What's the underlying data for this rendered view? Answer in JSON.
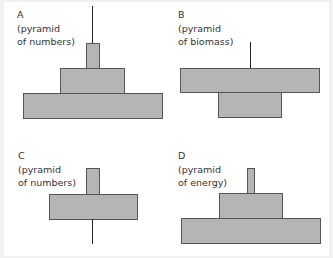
{
  "panels": [
    {
      "id": "A",
      "letter": "A",
      "caption_line1": "(pyramid",
      "caption_line2": "of numbers)",
      "type": "pyramid of numbers",
      "levels_top_to_bottom": [
        "narrow top bar with line above",
        "medium",
        "wide base"
      ]
    },
    {
      "id": "B",
      "letter": "B",
      "caption_line1": "(pyramid",
      "caption_line2": "of biomass)",
      "type": "pyramid of biomass",
      "levels_top_to_bottom": [
        "line",
        "wide",
        "medium"
      ]
    },
    {
      "id": "C",
      "letter": "C",
      "caption_line1": "(pyramid",
      "caption_line2": "of numbers)",
      "type": "pyramid of numbers",
      "levels_top_to_bottom": [
        "narrow",
        "wide",
        "line"
      ]
    },
    {
      "id": "D",
      "letter": "D",
      "caption_line1": "(pyramid",
      "caption_line2": "of energy)",
      "type": "pyramid of energy",
      "levels_top_to_bottom": [
        "very narrow",
        "medium",
        "wide base"
      ]
    }
  ],
  "colors": {
    "bar_fill": "#b5b5b5",
    "bar_border": "#555555",
    "line": "#222222",
    "background": "#ffffff",
    "frame": "#f1f1f1"
  }
}
